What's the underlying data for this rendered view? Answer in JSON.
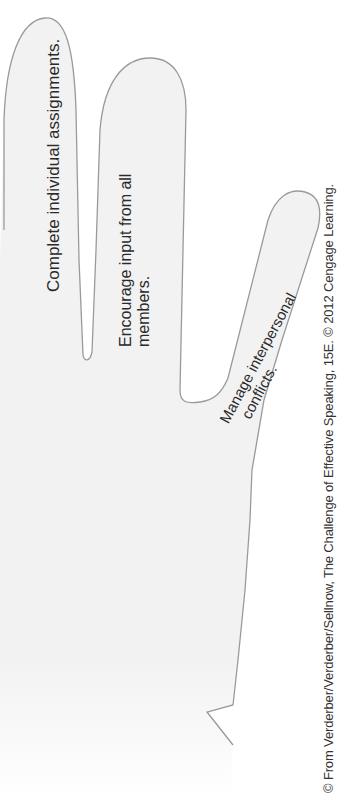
{
  "figure": {
    "colors": {
      "hand_fill": "#f2f2f2",
      "outline": "#9a9a9a",
      "text": "#2a2a2a",
      "background": "#ffffff"
    },
    "fingers": [
      {
        "label": "Complete individual assignments."
      },
      {
        "label": "Encourage input from all members.",
        "lines": [
          "Encourage input from all",
          "members."
        ]
      },
      {
        "label": "Manage interpersonal conflicts.",
        "lines": [
          "Manage interpersonal",
          "conflicts."
        ]
      }
    ],
    "credit": "© From Verderber/Verderber/Sellnow, The Challenge of Effective Speaking, 15E. © 2012 Cengage Learning."
  }
}
